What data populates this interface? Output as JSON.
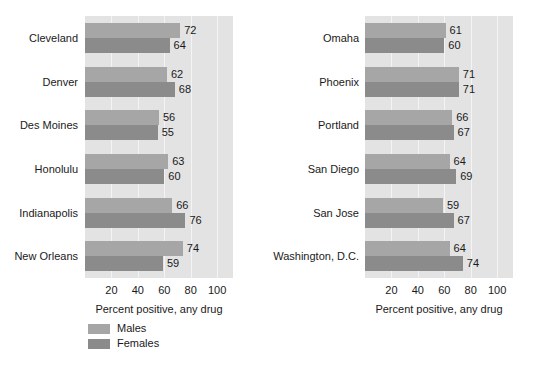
{
  "chart_data": [
    {
      "type": "bar",
      "orientation": "horizontal",
      "panel": "left",
      "title": "",
      "xlabel": "Percent positive, any drug",
      "ylabel": "",
      "xlim": [
        0,
        112
      ],
      "xticks": [
        20,
        40,
        60,
        80,
        100
      ],
      "grid": true,
      "legend_position": "below-left",
      "categories": [
        "Cleveland",
        "Denver",
        "Des Moines",
        "Honolulu",
        "Indianapolis",
        "New Orleans"
      ],
      "series": [
        {
          "name": "Males",
          "color": "#a6a6a6",
          "values": [
            72,
            62,
            56,
            63,
            66,
            74
          ]
        },
        {
          "name": "Females",
          "color": "#8b8b8b",
          "values": [
            64,
            68,
            55,
            60,
            76,
            59
          ]
        }
      ]
    },
    {
      "type": "bar",
      "orientation": "horizontal",
      "panel": "right",
      "title": "",
      "xlabel": "Percent positive, any drug",
      "ylabel": "",
      "xlim": [
        0,
        112
      ],
      "xticks": [
        20,
        40,
        60,
        80,
        100
      ],
      "grid": true,
      "legend_position": "none",
      "categories": [
        "Omaha",
        "Phoenix",
        "Portland",
        "San Diego",
        "San Jose",
        "Washington, D.C."
      ],
      "series": [
        {
          "name": "Males",
          "color": "#a6a6a6",
          "values": [
            61,
            71,
            66,
            64,
            59,
            64
          ]
        },
        {
          "name": "Females",
          "color": "#8b8b8b",
          "values": [
            60,
            71,
            67,
            69,
            67,
            74
          ]
        }
      ]
    }
  ],
  "legend": {
    "items": [
      {
        "label": "Males",
        "color": "#a6a6a6"
      },
      {
        "label": "Females",
        "color": "#8b8b8b"
      }
    ]
  },
  "axis": {
    "xlabel": "Percent positive, any drug",
    "tick_labels": [
      "20",
      "40",
      "60",
      "80",
      "100"
    ]
  },
  "colors": {
    "males": "#a6a6a6",
    "females": "#8b8b8b",
    "plot_background": "#e3e3e3",
    "gridline": "#f4f4f4",
    "page_background": "#ffffff",
    "text": "#1a1a1a"
  }
}
